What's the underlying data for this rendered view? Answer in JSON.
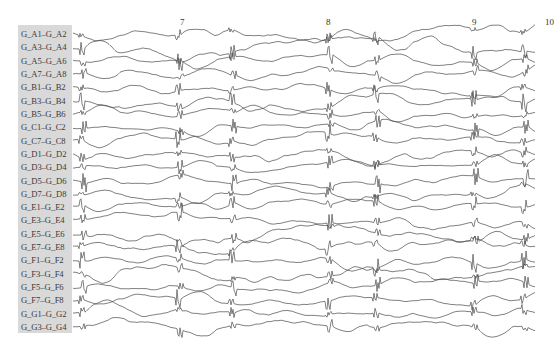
{
  "viewer": {
    "type": "eeg-montage",
    "time_markers": [
      {
        "label": "7",
        "x": 180
      },
      {
        "label": "8",
        "x": 326
      },
      {
        "label": "9",
        "x": 472
      },
      {
        "label": "10",
        "x": 545
      }
    ],
    "trace_color": "#4a4a4a",
    "label_panel_color": "#d9d9d9",
    "channels": [
      {
        "label": "G_A1–G_A2"
      },
      {
        "label": "G_A3–G_A4"
      },
      {
        "label": "G_A5–G_A6"
      },
      {
        "label": "G_A7–G_A8"
      },
      {
        "label": "G_B1–G_B2"
      },
      {
        "label": "G_B3–G_B4"
      },
      {
        "label": "G_B5–G_B6"
      },
      {
        "label": "G_C1–G_C2"
      },
      {
        "label": "G_C7–G_C8"
      },
      {
        "label": "G_D1–G_D2"
      },
      {
        "label": "G_D3–G_D4"
      },
      {
        "label": "G_D5–G_D6"
      },
      {
        "label": "G_D7–G_D8"
      },
      {
        "label": "G_E1–G_E2"
      },
      {
        "label": "G_E3–G_E4"
      },
      {
        "label": "G_E5–G_E6"
      },
      {
        "label": "G_E7–G_E8"
      },
      {
        "label": "G_F1–G_F2"
      },
      {
        "label": "G_F3–G_F4"
      },
      {
        "label": "G_F5–G_F6"
      },
      {
        "label": "G_F7–G_F8"
      },
      {
        "label": "G_G1–G_G2"
      },
      {
        "label": "G_G3–G_G4"
      }
    ],
    "discharge_x": [
      78,
      175,
      228,
      325,
      372,
      470,
      520
    ]
  }
}
